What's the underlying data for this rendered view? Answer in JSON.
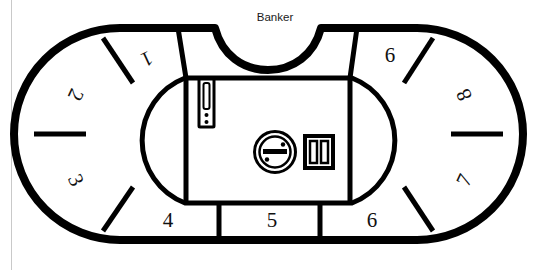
{
  "diagram": {
    "title_label": "Banker",
    "type": "baccarat-table-layout",
    "colors": {
      "outline": "#000000",
      "felt": "#ffffff",
      "text": "#111111",
      "page_edge": "#c9c9c9"
    },
    "seats": [
      {
        "id": "seat-1",
        "label": "1",
        "side": "top-left",
        "x": 146,
        "y": 57,
        "rotation": 155
      },
      {
        "id": "seat-2",
        "label": "2",
        "side": "left-upper",
        "x": 74,
        "y": 94,
        "rotation": 115
      },
      {
        "id": "seat-3",
        "label": "3",
        "side": "left-lower",
        "x": 74,
        "y": 181,
        "rotation": 65
      },
      {
        "id": "seat-4",
        "label": "4",
        "side": "bottom-left",
        "x": 168,
        "y": 222,
        "rotation": 0
      },
      {
        "id": "seat-5",
        "label": "5",
        "side": "bottom-center",
        "x": 272,
        "y": 222,
        "rotation": 0
      },
      {
        "id": "seat-6",
        "label": "6",
        "side": "bottom-right",
        "x": 372,
        "y": 222,
        "rotation": 0
      },
      {
        "id": "seat-7",
        "label": "7",
        "side": "right-lower",
        "x": 466,
        "y": 181,
        "rotation": -65
      },
      {
        "id": "seat-8",
        "label": "8",
        "side": "right-upper",
        "x": 466,
        "y": 94,
        "rotation": -115
      },
      {
        "id": "seat-9",
        "label": "6",
        "side": "top-right",
        "x": 390,
        "y": 57,
        "rotation": 0
      }
    ],
    "equipment": [
      {
        "id": "drop-slot",
        "name": "drop-box-slot",
        "label": "",
        "x": 199,
        "y": 79,
        "w": 15,
        "h": 48
      },
      {
        "id": "tip-box",
        "name": "commission-circle",
        "label": "",
        "x": 254,
        "y": 131,
        "w": 42,
        "h": 42
      },
      {
        "id": "chip-tray",
        "name": "chip-tray",
        "label": "",
        "x": 305,
        "y": 136,
        "w": 28,
        "h": 32
      }
    ]
  }
}
